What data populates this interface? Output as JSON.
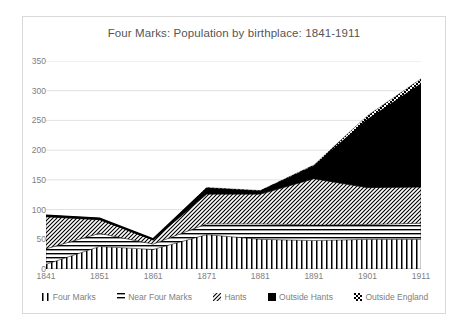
{
  "chart_data": {
    "type": "area",
    "stacked": true,
    "title": "Four Marks: Population by birthplace: 1841-1911",
    "xlabel": "",
    "ylabel": "",
    "categories": [
      "1841",
      "1851",
      "1861",
      "1871",
      "1881",
      "1891",
      "1901",
      "1911"
    ],
    "x": [
      1841,
      1851,
      1861,
      1871,
      1881,
      1891,
      1901,
      1911
    ],
    "ylim": [
      0,
      350
    ],
    "ytick_step": 50,
    "yticks": [
      "350",
      "300",
      "250",
      "200",
      "150",
      "100",
      "50",
      "0"
    ],
    "ytick_values": [
      350,
      300,
      250,
      200,
      150,
      100,
      50,
      0
    ],
    "grid": true,
    "grid_axis": "y",
    "legend_position": "bottom",
    "series": [
      {
        "name": "Four Marks",
        "fill": "vertical-lines",
        "color": "#000000",
        "values": [
          8,
          38,
          33,
          58,
          50,
          48,
          50,
          50
        ]
      },
      {
        "name": "Near Four Marks",
        "fill": "horizontal-lines",
        "color": "#000000",
        "values": [
          26,
          22,
          9,
          18,
          26,
          26,
          25,
          27
        ]
      },
      {
        "name": "Hants",
        "fill": "diagonal-hatch",
        "color": "#000000",
        "values": [
          54,
          23,
          7,
          50,
          50,
          78,
          62,
          61
        ]
      },
      {
        "name": "Outside Hants",
        "fill": "solid-black",
        "color": "#000000",
        "values": [
          2,
          2,
          1,
          9,
          4,
          20,
          113,
          172
        ]
      },
      {
        "name": "Outside England",
        "fill": "checkered",
        "color": "#000000",
        "values": [
          0,
          0,
          0,
          2,
          2,
          3,
          8,
          10
        ]
      }
    ],
    "totals": [
      90,
      85,
      50,
      137,
      132,
      175,
      258,
      320
    ]
  },
  "legend": [
    {
      "label": "Four Marks",
      "swatch": "vertical-lines-swatch"
    },
    {
      "label": "Near Four Marks",
      "swatch": "horizontal-lines-swatch"
    },
    {
      "label": "Hants",
      "swatch": "diagonal-hatch-swatch"
    },
    {
      "label": "Outside Hants",
      "swatch": "solid-black-swatch"
    },
    {
      "label": "Outside England",
      "swatch": "checkered-swatch"
    }
  ],
  "colors": {
    "frame_border": "#d9d9d9",
    "grid_line": "#d9d9d9",
    "text": "#808080",
    "title_text": "#555555",
    "series_ink": "#000000",
    "background": "#ffffff"
  }
}
